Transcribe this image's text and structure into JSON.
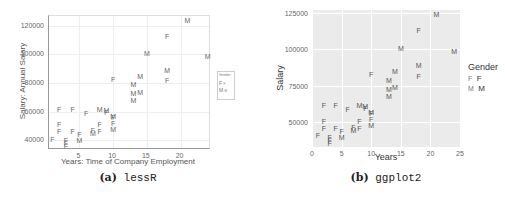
{
  "chart_data": [
    {
      "type": "scatter",
      "title": "",
      "caption_label": "(a)",
      "caption_name": "lessR",
      "xlabel": "Years: Time of Company Employment",
      "ylabel": "Salary: Annual Salary",
      "xticks": [
        5,
        10,
        15,
        20
      ],
      "yticks": [
        40000,
        60000,
        80000,
        100000,
        120000
      ],
      "xlim": [
        0.5,
        24.5
      ],
      "ylim": [
        33000,
        127000
      ],
      "grid": true,
      "legend": {
        "title": "Gender",
        "position": "right",
        "entries": [
          {
            "key": "F",
            "label": "F"
          },
          {
            "key": "M",
            "label": "M"
          }
        ]
      },
      "marker": "text-letter"
    },
    {
      "type": "scatter",
      "title": "",
      "caption_label": "(b)",
      "caption_name": "ggplot2",
      "xlabel": "Years",
      "ylabel": "Salary",
      "xticks": [
        0,
        5,
        10,
        15,
        20,
        25
      ],
      "yticks": [
        50000,
        75000,
        100000,
        125000
      ],
      "xlim": [
        0,
        25
      ],
      "ylim": [
        33000,
        127000
      ],
      "grid": true,
      "background": "#ebebeb",
      "legend": {
        "title": "Gender",
        "position": "right",
        "entries": [
          {
            "key": "F",
            "label": "F"
          },
          {
            "key": "M",
            "label": "M"
          }
        ]
      },
      "marker": "text-letter"
    }
  ],
  "points": [
    {
      "x": 1,
      "y": 41000,
      "g": "F"
    },
    {
      "x": 2,
      "y": 62000,
      "g": "F"
    },
    {
      "x": 2,
      "y": 51000,
      "g": "F"
    },
    {
      "x": 2,
      "y": 46000,
      "g": "F"
    },
    {
      "x": 3,
      "y": 40000,
      "g": "F"
    },
    {
      "x": 3,
      "y": 38000,
      "g": "F"
    },
    {
      "x": 3,
      "y": 36000,
      "g": "F"
    },
    {
      "x": 4,
      "y": 62000,
      "g": "F"
    },
    {
      "x": 4,
      "y": 46000,
      "g": "F"
    },
    {
      "x": 5,
      "y": 44000,
      "g": "F"
    },
    {
      "x": 5,
      "y": 40000,
      "g": "M"
    },
    {
      "x": 6,
      "y": 59000,
      "g": "F"
    },
    {
      "x": 7,
      "y": 47000,
      "g": "F"
    },
    {
      "x": 7,
      "y": 45000,
      "g": "M"
    },
    {
      "x": 8,
      "y": 62000,
      "g": "M"
    },
    {
      "x": 8,
      "y": 51000,
      "g": "F"
    },
    {
      "x": 8,
      "y": 46000,
      "g": "F"
    },
    {
      "x": 9,
      "y": 61000,
      "g": "M"
    },
    {
      "x": 9,
      "y": 60000,
      "g": "F"
    },
    {
      "x": 10,
      "y": 57000,
      "g": "M"
    },
    {
      "x": 10,
      "y": 56000,
      "g": "F"
    },
    {
      "x": 10,
      "y": 52000,
      "g": "F"
    },
    {
      "x": 10,
      "y": 48000,
      "g": "M"
    },
    {
      "x": 10,
      "y": 83000,
      "g": "F"
    },
    {
      "x": 13,
      "y": 79000,
      "g": "M"
    },
    {
      "x": 13,
      "y": 73000,
      "g": "M"
    },
    {
      "x": 13,
      "y": 68000,
      "g": "M"
    },
    {
      "x": 14,
      "y": 85000,
      "g": "M"
    },
    {
      "x": 14,
      "y": 74000,
      "g": "M"
    },
    {
      "x": 15,
      "y": 101000,
      "g": "M"
    },
    {
      "x": 18,
      "y": 113000,
      "g": "F"
    },
    {
      "x": 18,
      "y": 89000,
      "g": "M"
    },
    {
      "x": 18,
      "y": 82000,
      "g": "F"
    },
    {
      "x": 21,
      "y": 124000,
      "g": "M"
    },
    {
      "x": 24,
      "y": 99000,
      "g": "M"
    }
  ],
  "colors": {
    "text": "#555555",
    "ggplot_bg": "#ebebeb",
    "grid_light": "#e6e6e6"
  }
}
